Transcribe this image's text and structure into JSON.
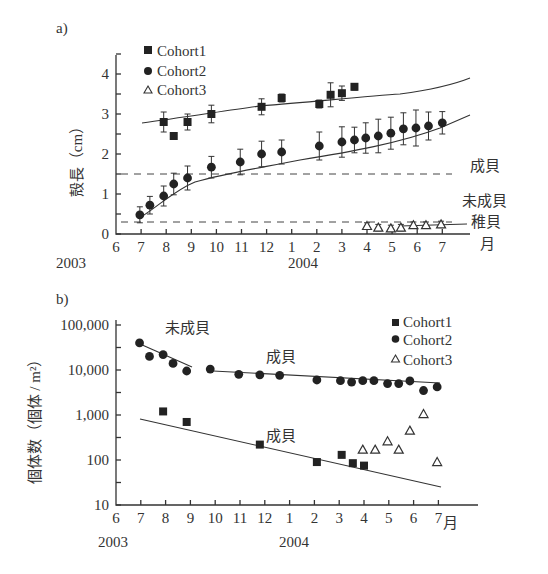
{
  "chart_data": [
    {
      "panel": "a)",
      "type": "scatter",
      "ylabel": "殻長（cm）",
      "xlabel": "月",
      "x_ticks": [
        "6",
        "7",
        "8",
        "9",
        "10",
        "11",
        "12",
        "1",
        "2",
        "3",
        "4",
        "5",
        "6",
        "7"
      ],
      "year_labels": [
        "2003",
        "2004"
      ],
      "y_ticks": [
        "0",
        "1",
        "2",
        "3",
        "4"
      ],
      "ylim": [
        0,
        4.5
      ],
      "legend": [
        "Cohort1",
        "Cohort2",
        "Cohort3"
      ],
      "annotations": [
        "成貝",
        "未成貝",
        "稚貝"
      ],
      "thresholds": [
        1.5,
        0.3
      ],
      "series": [
        {
          "name": "Cohort1",
          "marker": "square",
          "x": [
            7.9,
            8.3,
            8.85,
            9.8,
            11.8,
            12.6,
            14.1,
            14.55,
            15.0,
            15.5
          ],
          "y": [
            2.8,
            2.45,
            2.8,
            3.0,
            3.18,
            3.4,
            3.25,
            3.48,
            3.52,
            3.68
          ],
          "err": [
            0.25,
            0.08,
            0.2,
            0.22,
            0.2,
            0.1,
            0.1,
            0.3,
            0.18,
            0.08
          ]
        },
        {
          "name": "Cohort2",
          "marker": "circle",
          "x": [
            6.95,
            7.35,
            7.9,
            8.3,
            8.85,
            9.8,
            10.95,
            11.8,
            12.6,
            14.1,
            15.0,
            15.5,
            15.95,
            16.45,
            16.95,
            17.45,
            17.95,
            18.45,
            19.0
          ],
          "y": [
            0.48,
            0.72,
            0.95,
            1.25,
            1.4,
            1.67,
            1.8,
            2.0,
            2.05,
            2.2,
            2.3,
            2.35,
            2.4,
            2.45,
            2.52,
            2.63,
            2.65,
            2.7,
            2.78
          ],
          "err": [
            0.2,
            0.22,
            0.25,
            0.27,
            0.3,
            0.27,
            0.32,
            0.32,
            0.3,
            0.35,
            0.38,
            0.32,
            0.38,
            0.42,
            0.4,
            0.4,
            0.45,
            0.35,
            0.28
          ]
        },
        {
          "name": "Cohort3",
          "marker": "triangle-open",
          "x": [
            16.0,
            16.45,
            16.95,
            17.35,
            17.85,
            18.35,
            18.95
          ],
          "y": [
            0.2,
            0.16,
            0.14,
            0.16,
            0.22,
            0.22,
            0.24
          ],
          "err": [
            0.08,
            0.08,
            0.08,
            0.08,
            0.08,
            0.08,
            0.08
          ]
        }
      ]
    },
    {
      "panel": "b)",
      "type": "scatter",
      "ylabel": "個体数（個体 / m²）",
      "xlabel": "月",
      "x_ticks": [
        "6",
        "7",
        "8",
        "9",
        "10",
        "11",
        "12",
        "1",
        "2",
        "3",
        "4",
        "5",
        "6",
        "7"
      ],
      "year_labels": [
        "2003",
        "2004"
      ],
      "y_ticks": [
        "10",
        "100",
        "1,000",
        "10,000",
        "100,000"
      ],
      "yscale": "log",
      "ylim": [
        10,
        100000
      ],
      "legend": [
        "Cohort1",
        "Cohort2",
        "Cohort3"
      ],
      "annotations": [
        "未成貝",
        "成貝",
        "成貝"
      ],
      "series": [
        {
          "name": "Cohort1",
          "marker": "square",
          "x": [
            7.9,
            8.85,
            11.8,
            14.1,
            15.1,
            15.55,
            16.0,
            18.95
          ],
          "y": [
            1200,
            700,
            220,
            90,
            130,
            85,
            75,
            null
          ]
        },
        {
          "name": "Cohort2",
          "marker": "circle",
          "x": [
            6.95,
            7.35,
            7.9,
            8.3,
            8.85,
            9.8,
            10.95,
            11.8,
            12.6,
            14.1,
            15.05,
            15.5,
            15.95,
            16.4,
            16.95,
            17.4,
            17.85,
            18.4,
            18.95
          ],
          "y": [
            40000,
            20000,
            22000,
            14000,
            9500,
            10500,
            8000,
            7800,
            7600,
            6000,
            5800,
            5400,
            5800,
            5800,
            5000,
            5000,
            5700,
            3500,
            4200
          ]
        },
        {
          "name": "Cohort3",
          "marker": "triangle-open",
          "x": [
            15.95,
            16.45,
            16.95,
            17.4,
            17.85,
            18.4,
            18.95
          ],
          "y": [
            170,
            170,
            260,
            170,
            450,
            1050,
            90
          ]
        }
      ]
    }
  ]
}
